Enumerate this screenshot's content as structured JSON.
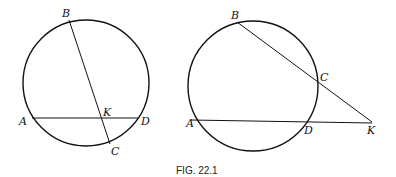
{
  "caption": "FIG. 22.1",
  "left_figure": {
    "points": {
      "A": "A",
      "B": "B",
      "C": "C",
      "D": "D",
      "K": "K"
    },
    "description": "Two chords AD and BC intersecting at K inside the circle"
  },
  "right_figure": {
    "points": {
      "A": "A",
      "B": "B",
      "C": "C",
      "D": "D",
      "K": "K"
    },
    "description": "Two secants KB and KA drawn from external point K"
  }
}
